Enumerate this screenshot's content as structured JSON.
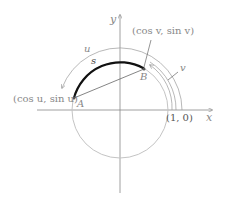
{
  "diagram": {
    "axes": {
      "x_label": "x",
      "y_label": "y"
    },
    "circle": {
      "center": [
        120,
        110
      ],
      "radius": 48,
      "color": "#bbbbbb"
    },
    "points": {
      "A": {
        "label": "A",
        "coord_label": "(cos u, sin u)"
      },
      "B": {
        "label": "B",
        "coord_label": "(cos v, sin v)"
      }
    },
    "unit_point_label": "(1, 0)",
    "arc_label": "s",
    "angle_u_label": "u",
    "angle_v_label": "v",
    "colors": {
      "arc": "#111111",
      "axes": "#888888",
      "text": "#888888"
    }
  }
}
